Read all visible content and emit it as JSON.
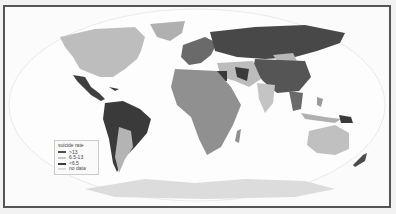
{
  "map": {
    "type": "choropleth",
    "projection": "robinson",
    "colors": {
      "high": "#505050",
      "mid": "#b4b4b4",
      "low": "#3c3c3c",
      "nodata": "#dcdcdc",
      "ocean": "#fbfbfb",
      "frame": "#555555"
    }
  },
  "legend": {
    "title": "suicide rate",
    "items": [
      {
        "label": ">13",
        "color": "#505050"
      },
      {
        "label": "6.5-13",
        "color": "#c8c8c8"
      },
      {
        "label": "<6.5",
        "color": "#3c3c3c"
      },
      {
        "label": "no data",
        "color": "#dcdcdc"
      }
    ]
  }
}
